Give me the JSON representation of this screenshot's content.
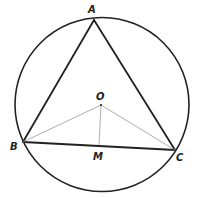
{
  "diagram": {
    "circle": {
      "cx": 102,
      "cy": 104.5,
      "r": 87,
      "stroke": "#222222"
    },
    "points": {
      "A": {
        "label": "A",
        "x": 94,
        "y": 20,
        "lx": 88,
        "ly": 13
      },
      "B": {
        "label": "B",
        "x": 23,
        "y": 142,
        "lx": 10,
        "ly": 150
      },
      "C": {
        "label": "C",
        "x": 175,
        "y": 150,
        "lx": 176,
        "ly": 161
      },
      "O": {
        "label": "O",
        "x": 101,
        "y": 105,
        "lx": 96,
        "ly": 100
      },
      "M": {
        "label": "M",
        "x": 99,
        "y": 146,
        "lx": 93,
        "ly": 160
      }
    },
    "segments": [
      {
        "from": "A",
        "to": "B",
        "style": "thick"
      },
      {
        "from": "A",
        "to": "C",
        "style": "thick"
      },
      {
        "from": "B",
        "to": "C",
        "style": "thick"
      },
      {
        "from": "O",
        "to": "B",
        "style": "thin"
      },
      {
        "from": "O",
        "to": "C",
        "style": "thin"
      },
      {
        "from": "O",
        "to": "M",
        "style": "thin"
      }
    ],
    "colors": {
      "thick": "#222222",
      "thin": "#999999"
    }
  }
}
